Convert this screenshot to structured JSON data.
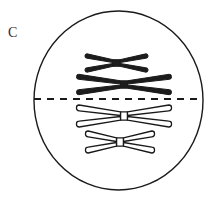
{
  "figure": {
    "panel_label": "C",
    "width": 212,
    "height": 202,
    "background_color": "#ffffff",
    "title": "",
    "caption": ""
  },
  "colors": {
    "outline": "#1a1a1a",
    "chromosome_dark_fill": "#1c1c1c",
    "chromosome_light_fill": "#ffffff",
    "chromosome_stroke": "#1a1a1a",
    "equator_line": "#1a1a1a",
    "label_text": "#2b2b2b"
  },
  "cell": {
    "name": "cell-membrane",
    "shape": "ellipse",
    "center_x": 118.5,
    "center_y": 100.5,
    "radius_x": 84.5,
    "radius_y": 89.5,
    "stroke_width": 1.4,
    "fill": "none"
  },
  "equator": {
    "name": "metaphase-plate",
    "style": "dashed",
    "y": 99,
    "x_start": 34,
    "x_end": 203,
    "stroke_width": 2,
    "dash_pattern": "7 6"
  },
  "chromosomes": [
    {
      "id": 1,
      "label": "maternal-short-chromosome",
      "fill_style": "dark",
      "center_x": 116.5,
      "center_y": 63,
      "arm_length": 28,
      "arm_thickness": 4.6,
      "arm_gap": 4.6,
      "centromere_width": 7
    },
    {
      "id": 2,
      "label": "maternal-long-chromosome",
      "fill_style": "dark",
      "center_x": 124,
      "center_y": 84.5,
      "arm_length": 44,
      "arm_thickness": 5.2,
      "arm_gap": 5.0,
      "centromere_width": 7
    },
    {
      "id": 3,
      "label": "paternal-long-chromosome",
      "fill_style": "light",
      "center_x": 124,
      "center_y": 116,
      "arm_length": 44,
      "arm_thickness": 6.0,
      "arm_gap": 5.0,
      "centromere_width": 7
    },
    {
      "id": 4,
      "label": "paternal-short-chromosome",
      "fill_style": "light",
      "center_x": 120,
      "center_y": 142,
      "arm_length": 31,
      "arm_thickness": 6.0,
      "arm_gap": 5.0,
      "centromere_width": 7
    }
  ]
}
